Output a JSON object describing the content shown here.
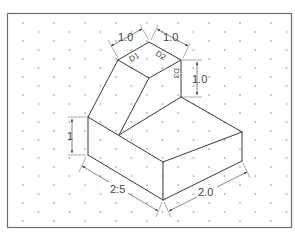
{
  "drawing": {
    "type": "isometric-dimensioned-part",
    "grid": "isometric-dot-grid",
    "colors": {
      "line": "#3a3a3a",
      "frame": "#6e6e6e",
      "dimension": "#555555",
      "dots": "#8a8a8a"
    },
    "dimensions": {
      "top_left_width": "1.0",
      "top_right_width": "1.0",
      "right_step_height": "1.0",
      "left_base_height": "1",
      "base_length": "2:5",
      "base_depth": "2.0"
    },
    "face_labels": {
      "d1": "D1",
      "d2": "D2",
      "d3": "D3"
    }
  }
}
